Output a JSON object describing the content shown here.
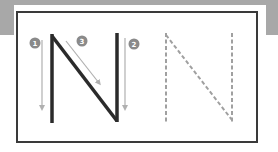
{
  "diagram": {
    "letter": "N",
    "colors": {
      "band": "#a8a8a8",
      "border": "#3a3a3a",
      "solid_letter": "#2b2b2b",
      "arrow": "#b0b0b0",
      "badge": "#8a8a8a",
      "dashed_letter": "#a0a0a0"
    },
    "strokes": [
      {
        "order": "1",
        "label": "1",
        "direction": "down",
        "part": "left-stem"
      },
      {
        "order": "2",
        "label": "2",
        "direction": "down",
        "part": "right-stem"
      },
      {
        "order": "3",
        "label": "3",
        "direction": "diagonal-down-right",
        "part": "diagonal"
      }
    ],
    "panels": [
      {
        "name": "guided-letter",
        "style": "solid with numbered arrows"
      },
      {
        "name": "tracing-letter",
        "style": "dashed"
      }
    ]
  }
}
